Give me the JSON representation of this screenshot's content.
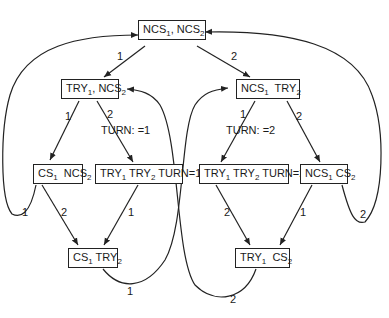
{
  "diagram": {
    "type": "state-transition-graph",
    "nodes": [
      {
        "id": "n0",
        "parts": [
          {
            "t": "NCS",
            "s": "1"
          },
          {
            "t": ", NCS",
            "s": "2"
          }
        ],
        "text": "NCS1, NCS2"
      },
      {
        "id": "n1",
        "parts": [
          {
            "t": "TRY",
            "s": "1"
          },
          {
            "t": ", NCS",
            "s": "2"
          }
        ],
        "text": "TRY1, NCS2"
      },
      {
        "id": "n2",
        "parts": [
          {
            "t": "NCS",
            "s": "1"
          },
          {
            "t": "  TRY",
            "s": "2"
          }
        ],
        "text": "NCS1 TRY2"
      },
      {
        "id": "n3",
        "parts": [
          {
            "t": "CS",
            "s": "1"
          },
          {
            "t": "  NCS",
            "s": "2"
          }
        ],
        "text": "CS1 NCS2"
      },
      {
        "id": "n4",
        "parts": [
          {
            "t": "TRY",
            "s": "1"
          },
          {
            "t": " TRY",
            "s": "2"
          },
          {
            "t": " TURN=1",
            "s": ""
          }
        ],
        "text": "TRY1 TRY2 TURN=1"
      },
      {
        "id": "n5",
        "parts": [
          {
            "t": "TRY",
            "s": "1"
          },
          {
            "t": " TRY",
            "s": "2"
          },
          {
            "t": " TURN=2",
            "s": ""
          }
        ],
        "text": "TRY1 TRY2 TURN=2"
      },
      {
        "id": "n6",
        "parts": [
          {
            "t": "NCS",
            "s": "1"
          },
          {
            "t": " CS",
            "s": "2"
          }
        ],
        "text": "NCS1 CS2"
      },
      {
        "id": "n7",
        "parts": [
          {
            "t": "CS",
            "s": "1"
          },
          {
            "t": " TRY",
            "s": "2"
          }
        ],
        "text": "CS1 TRY2"
      },
      {
        "id": "n8",
        "parts": [
          {
            "t": "TRY",
            "s": "1"
          },
          {
            "t": "  CS",
            "s": "2"
          }
        ],
        "text": "TRY1 CS2"
      }
    ],
    "edges": [
      {
        "from": "n0",
        "to": "n1",
        "label": "1"
      },
      {
        "from": "n0",
        "to": "n2",
        "label": "2"
      },
      {
        "from": "n1",
        "to": "n3",
        "label": "1"
      },
      {
        "from": "n1",
        "to": "n4",
        "label": "2",
        "action": "TURN: =1"
      },
      {
        "from": "n2",
        "to": "n5",
        "label": "1",
        "action": "TURN: =2"
      },
      {
        "from": "n2",
        "to": "n6",
        "label": "2"
      },
      {
        "from": "n3",
        "to": "n7",
        "label": "2"
      },
      {
        "from": "n4",
        "to": "n7",
        "label": "1"
      },
      {
        "from": "n5",
        "to": "n8",
        "label": "2"
      },
      {
        "from": "n6",
        "to": "n8",
        "label": "1"
      },
      {
        "from": "n3",
        "to": "n0",
        "label": "1"
      },
      {
        "from": "n6",
        "to": "n0",
        "label": "2"
      },
      {
        "from": "n7",
        "to": "n2",
        "label": "1"
      },
      {
        "from": "n8",
        "to": "n1",
        "label": "2"
      }
    ],
    "labels": {
      "e01": "1",
      "e02": "2",
      "e13": "1",
      "e14": "2",
      "turn1": "TURN: =1",
      "e25": "1",
      "turn2": "TURN: =2",
      "e26": "2",
      "e37": "2",
      "e47": "1",
      "e58": "2",
      "e68": "1",
      "e30": "1",
      "e60": "2",
      "e72": "1",
      "e81": "2"
    }
  }
}
